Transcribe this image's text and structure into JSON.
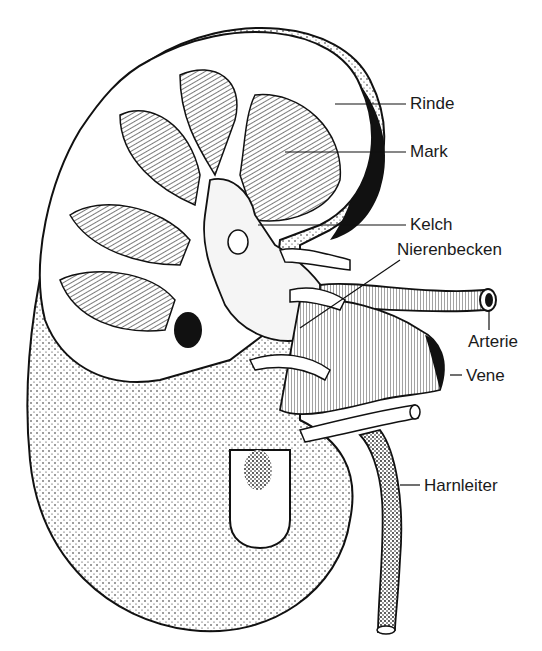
{
  "diagram": {
    "labels": {
      "rinde": "Rinde",
      "mark": "Mark",
      "kelch": "Kelch",
      "nierenbecken": "Nierenbecken",
      "arterie": "Arterie",
      "vene": "Vene",
      "harnleiter": "Harnleiter"
    }
  }
}
